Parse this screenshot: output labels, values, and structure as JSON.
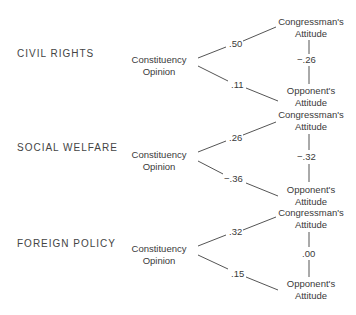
{
  "diagram": {
    "sections": [
      {
        "topic": "CIVIL RIGHTS",
        "source": "Constituency Opinion",
        "source_lines": [
          "Constituency",
          "Opinion"
        ],
        "target_top_lines": [
          "Congressman's",
          "Attitude"
        ],
        "target_bottom_lines": [
          "Opponent's",
          "Attitude"
        ],
        "coef_top": ".50",
        "coef_bottom": ".11",
        "coef_vertical": "−.26"
      },
      {
        "topic": "SOCIAL WELFARE",
        "source": "Constituency Opinion",
        "source_lines": [
          "Constituency",
          "Opinion"
        ],
        "target_top_lines": [
          "Congressman's",
          "Attitude"
        ],
        "target_bottom_lines": [
          "Opponent's",
          "Attitude"
        ],
        "coef_top": ".26",
        "coef_bottom": "−.36",
        "coef_vertical": "−.32"
      },
      {
        "topic": "FOREIGN POLICY",
        "source": "Constituency Opinion",
        "source_lines": [
          "Constituency",
          "Opinion"
        ],
        "target_top_lines": [
          "Congressman's",
          "Attitude"
        ],
        "target_bottom_lines": [
          "Opponent's",
          "Attitude"
        ],
        "coef_top": ".32",
        "coef_bottom": ".15",
        "coef_vertical": ".00"
      }
    ]
  }
}
